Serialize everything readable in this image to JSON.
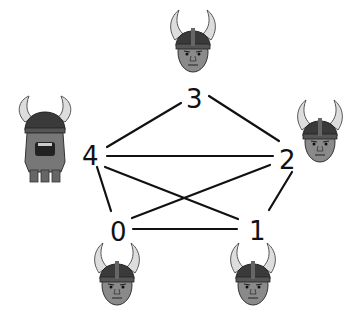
{
  "graph": {
    "nodes": [
      {
        "id": "0",
        "label": "0",
        "x": 120,
        "y": 232,
        "figure": "viking-head",
        "figure_x": 117,
        "figure_y": 278
      },
      {
        "id": "1",
        "label": "1",
        "x": 256,
        "y": 230,
        "figure": "viking-head-frowning",
        "figure_x": 253,
        "figure_y": 278
      },
      {
        "id": "2",
        "label": "2",
        "x": 288,
        "y": 160,
        "figure": "viking-head",
        "figure_x": 320,
        "figure_y": 135
      },
      {
        "id": "3",
        "label": "3",
        "x": 196,
        "y": 100,
        "figure": "viking-head",
        "figure_x": 193,
        "figure_y": 43
      },
      {
        "id": "4",
        "label": "4",
        "x": 92,
        "y": 155,
        "figure": "viking-full-body-shouting",
        "figure_x": 45,
        "figure_y": 145
      }
    ],
    "edges": [
      [
        "3",
        "4"
      ],
      [
        "3",
        "2"
      ],
      [
        "4",
        "2"
      ],
      [
        "4",
        "0"
      ],
      [
        "4",
        "1"
      ],
      [
        "0",
        "2"
      ],
      [
        "0",
        "1"
      ],
      [
        "2",
        "1"
      ]
    ]
  }
}
